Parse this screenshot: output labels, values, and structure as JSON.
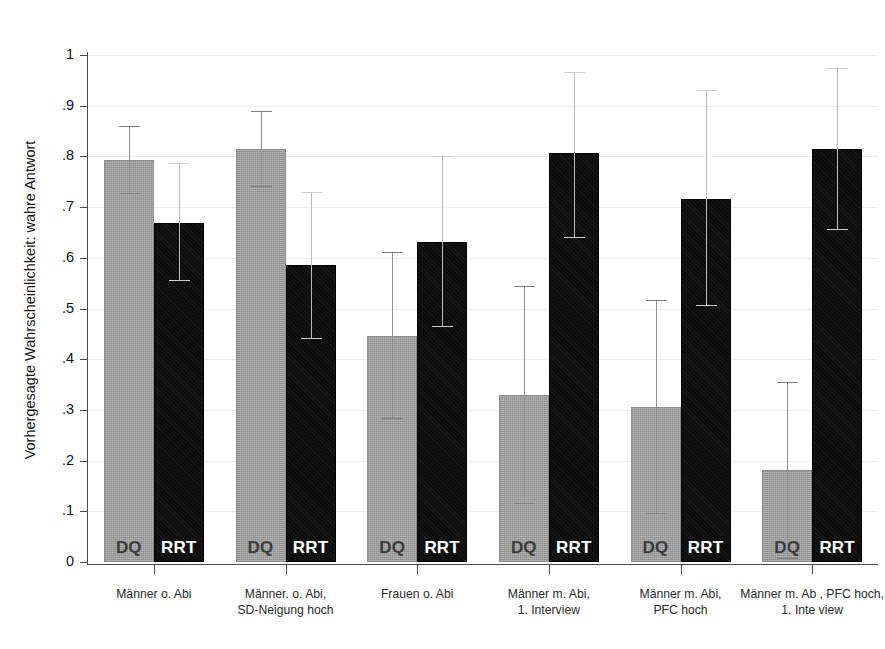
{
  "chart_data": {
    "type": "bar",
    "title": "",
    "xlabel": "",
    "ylabel": "Vorhergesagte Wahrscheinlichkeit: wahre Antwort",
    "ylim": [
      0,
      1
    ],
    "yticks": [
      "0",
      ".1",
      ".2",
      ".3",
      ".4",
      ".5",
      ".6",
      ".7",
      ".8",
      ".9",
      "1"
    ],
    "ytick_values": [
      0,
      0.1,
      0.2,
      0.3,
      0.4,
      0.5,
      0.6,
      0.7,
      0.8,
      0.9,
      1
    ],
    "grid": true,
    "legend": "in-bar labels",
    "categories": [
      "Männer o. Abi",
      "Männer. o. Abi,\nSD-Neigung hoch",
      "Frauen o. Abi",
      "Männer m. Abi,\n1. Interview",
      "Männer m. Abi,\nPFC hoch",
      "Männer m. Ab , PFC hoch,\n1. Inte view"
    ],
    "series": [
      {
        "name": "DQ",
        "label": "DQ",
        "color": "#9d9d9d",
        "values": [
          0.793,
          0.815,
          0.445,
          0.329,
          0.305,
          0.181
        ],
        "ci_low": [
          0.727,
          0.741,
          0.284,
          0.116,
          0.096,
          0.008
        ],
        "ci_high": [
          0.86,
          0.89,
          0.611,
          0.545,
          0.516,
          0.355
        ]
      },
      {
        "name": "RRT",
        "label": "RRT",
        "color": "#0d0d0d",
        "values": [
          0.669,
          0.585,
          0.632,
          0.806,
          0.716,
          0.814
        ],
        "ci_low": [
          0.556,
          0.441,
          0.466,
          0.641,
          0.506,
          0.656
        ],
        "ci_high": [
          0.786,
          0.729,
          0.8,
          0.966,
          0.93,
          0.974
        ]
      }
    ]
  }
}
